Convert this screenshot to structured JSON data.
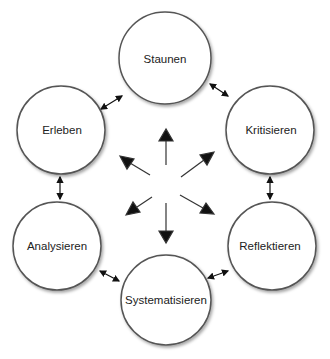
{
  "diagram": {
    "nodes": [
      {
        "id": "staunen",
        "label": "Staunen",
        "cx": 165,
        "cy": 58,
        "r": 46
      },
      {
        "id": "kritisieren",
        "label": "Kritisieren",
        "cx": 270,
        "cy": 130,
        "r": 44
      },
      {
        "id": "reflektieren",
        "label": "Reflektieren",
        "cx": 272,
        "cy": 246,
        "r": 44
      },
      {
        "id": "systematisieren",
        "label": "Systematisieren",
        "cx": 166,
        "cy": 300,
        "r": 45
      },
      {
        "id": "analysieren",
        "label": "Analysieren",
        "cx": 57,
        "cy": 246,
        "r": 44
      },
      {
        "id": "erleben",
        "label": "Erleben",
        "cx": 61,
        "cy": 130,
        "r": 44
      }
    ],
    "edges": [
      {
        "from": "staunen",
        "to": "kritisieren",
        "type": "bidirectional"
      },
      {
        "from": "kritisieren",
        "to": "reflektieren",
        "type": "bidirectional"
      },
      {
        "from": "reflektieren",
        "to": "systematisieren",
        "type": "bidirectional"
      },
      {
        "from": "systematisieren",
        "to": "analysieren",
        "type": "bidirectional"
      },
      {
        "from": "analysieren",
        "to": "erleben",
        "type": "bidirectional"
      },
      {
        "from": "erleben",
        "to": "staunen",
        "type": "bidirectional"
      }
    ],
    "center_arrows": [
      "up",
      "up-right",
      "down-right",
      "down",
      "down-left",
      "up-left"
    ],
    "colors": {
      "stroke": "#555555",
      "arrow": "#111111",
      "fill": "#ffffff",
      "text": "#222222"
    }
  }
}
